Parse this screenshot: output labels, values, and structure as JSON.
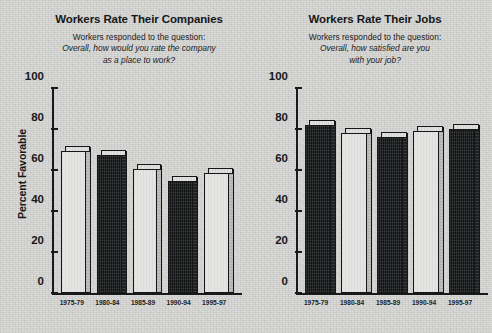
{
  "figure": {
    "background_color": "#d6d6d4",
    "ylabel": "Percent Favorable"
  },
  "chart_data": [
    {
      "type": "bar",
      "id": "companies",
      "title": "Workers Rate Their Companies",
      "subtitle_line1": "Workers responded to the question:",
      "subtitle_line2": "Overall, how would you rate the company",
      "subtitle_line3": "as a place to work?",
      "categories": [
        "1975-79",
        "1980-84",
        "1985-89",
        "1990-94",
        "1995-97"
      ],
      "values": [
        70,
        68,
        61,
        55,
        59
      ],
      "bar_styles": [
        "light",
        "dark",
        "light",
        "dark",
        "light"
      ],
      "xlabel": "",
      "ylabel": "Percent Favorable",
      "ylim": [
        0,
        100
      ],
      "yticks": [
        0,
        20,
        40,
        60,
        80,
        100
      ],
      "grid": false,
      "legend": "none"
    },
    {
      "type": "bar",
      "id": "jobs",
      "title": "Workers Rate Their Jobs",
      "subtitle_line1": "Workers responded to the question:",
      "subtitle_line2": "Overall, how satisfied are you",
      "subtitle_line3": "with your job?",
      "categories": [
        "1975-79",
        "1980-84",
        "1985-89",
        "1990-94",
        "1995-97"
      ],
      "values": [
        83,
        79,
        77,
        80,
        81
      ],
      "bar_styles": [
        "dark",
        "light",
        "dark",
        "light",
        "dark"
      ],
      "xlabel": "",
      "ylabel": "Percent Favorable",
      "ylim": [
        0,
        100
      ],
      "yticks": [
        0,
        20,
        40,
        60,
        80,
        100
      ],
      "grid": false,
      "legend": "none"
    }
  ]
}
